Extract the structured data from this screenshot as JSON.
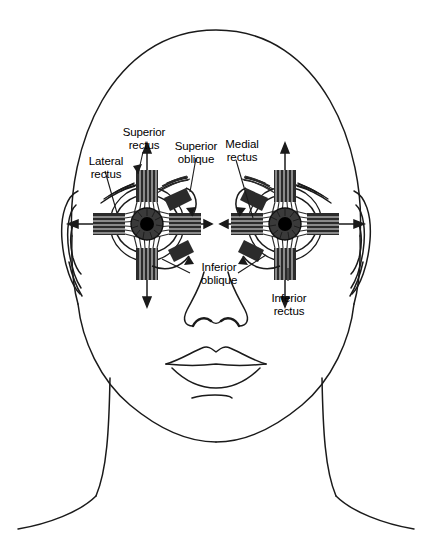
{
  "figure": {
    "ink_color": "#1a1a1a",
    "muscle_color": "#2b2b2b",
    "background_color": "#ffffff"
  },
  "labels": [
    {
      "id": "lateral-rectus",
      "line1": "Lateral",
      "line2": "rectus"
    },
    {
      "id": "superior-rectus",
      "line1": "Superior",
      "line2": "rectus"
    },
    {
      "id": "superior-oblique",
      "line1": "Superior",
      "line2": "oblique"
    },
    {
      "id": "medial-rectus",
      "line1": "Medial",
      "line2": "rectus"
    },
    {
      "id": "inferior-oblique",
      "line1": "Inferior",
      "line2": "oblique"
    },
    {
      "id": "inferior-rectus",
      "line1": "Inferior",
      "line2": "rectus"
    }
  ]
}
